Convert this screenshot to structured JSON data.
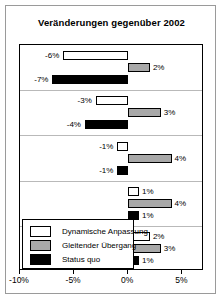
{
  "chart_data": {
    "type": "bar",
    "orientation": "horizontal",
    "title": "Veränderungen gegenüber 2002",
    "xlabel": "",
    "ylabel": "",
    "xlim": [
      -10,
      7
    ],
    "xticks": [
      -10,
      -5,
      0,
      5
    ],
    "xtick_labels": [
      "-10%",
      "-5%",
      "0%",
      "5%"
    ],
    "grid": false,
    "legend_position": "bottom-left",
    "categories": [
      "Gruppe 1",
      "Gruppe 2",
      "Gruppe 3",
      "Gruppe 4",
      "Gruppe 5"
    ],
    "series": [
      {
        "name": "Dynamische Anpassung",
        "color": "#ffffff",
        "values": [
          -6,
          -3,
          -1,
          1,
          2
        ],
        "labels": [
          "-6%",
          "-3%",
          "-1%",
          "1%",
          "2%"
        ]
      },
      {
        "name": "Gleitender Übergang",
        "color": "#a8a8a8",
        "values": [
          2,
          3,
          4,
          4,
          3
        ],
        "labels": [
          "2%",
          "3%",
          "4%",
          "4%",
          "3%"
        ]
      },
      {
        "name": "Status quo",
        "color": "#000000",
        "values": [
          -7,
          -4,
          -1,
          1,
          1
        ],
        "labels": [
          "-7%",
          "-4%",
          "-1%",
          "1%",
          "1%"
        ]
      }
    ]
  },
  "title": {
    "text": "Veränderungen gegenüber 2002"
  },
  "axis": {
    "ticks": [
      {
        "label": "-10%",
        "value": -10
      },
      {
        "label": "-5%",
        "value": -5
      },
      {
        "label": "0%",
        "value": 0
      },
      {
        "label": "5%",
        "value": 5
      }
    ]
  },
  "legend": {
    "items": [
      {
        "label": "Dynamische Anpassung",
        "swatch": "white"
      },
      {
        "label": "Gleitender Übergang",
        "swatch": "gray"
      },
      {
        "label": "Status quo",
        "swatch": "black"
      }
    ]
  },
  "bars": [
    {
      "label": "-6%",
      "series": 0,
      "group": 0,
      "value": -6,
      "swatch": "white"
    },
    {
      "label": "2%",
      "series": 1,
      "group": 0,
      "value": 2,
      "swatch": "gray"
    },
    {
      "label": "-7%",
      "series": 2,
      "group": 0,
      "value": -7,
      "swatch": "black"
    },
    {
      "label": "-3%",
      "series": 0,
      "group": 1,
      "value": -3,
      "swatch": "white"
    },
    {
      "label": "3%",
      "series": 1,
      "group": 1,
      "value": 3,
      "swatch": "gray"
    },
    {
      "label": "-4%",
      "series": 2,
      "group": 1,
      "value": -4,
      "swatch": "black"
    },
    {
      "label": "-1%",
      "series": 0,
      "group": 2,
      "value": -1,
      "swatch": "white"
    },
    {
      "label": "4%",
      "series": 1,
      "group": 2,
      "value": 4,
      "swatch": "gray"
    },
    {
      "label": "-1%",
      "series": 2,
      "group": 2,
      "value": -1,
      "swatch": "black"
    },
    {
      "label": "1%",
      "series": 0,
      "group": 3,
      "value": 1,
      "swatch": "white"
    },
    {
      "label": "4%",
      "series": 1,
      "group": 3,
      "value": 4,
      "swatch": "gray"
    },
    {
      "label": "1%",
      "series": 2,
      "group": 3,
      "value": 1,
      "swatch": "black"
    },
    {
      "label": "2%",
      "series": 0,
      "group": 4,
      "value": 2,
      "swatch": "white"
    },
    {
      "label": "3%",
      "series": 1,
      "group": 4,
      "value": 3,
      "swatch": "gray"
    },
    {
      "label": "1%",
      "series": 2,
      "group": 4,
      "value": 1,
      "swatch": "black"
    }
  ]
}
